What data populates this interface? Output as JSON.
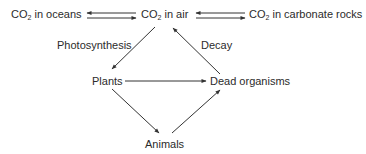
{
  "diagram": {
    "colors": {
      "text": "#2b2b2b",
      "arrow": "#333333",
      "background": "#ffffff"
    },
    "nodes": {
      "co2_oceans": {
        "prefix": "CO",
        "sub": "2",
        "suffix": " in oceans"
      },
      "co2_air": {
        "prefix": "CO",
        "sub": "2",
        "suffix": " in air"
      },
      "co2_rocks": {
        "prefix": "CO",
        "sub": "2",
        "suffix": " in carbonate rocks"
      },
      "plants": {
        "label": "Plants"
      },
      "dead": {
        "label": "Dead organisms"
      },
      "animals": {
        "label": "Animals"
      }
    },
    "edge_labels": {
      "photosynthesis": "Photosynthesis",
      "decay": "Decay"
    },
    "edges": [
      {
        "from": "CO2 in air",
        "to": "CO2 in oceans"
      },
      {
        "from": "CO2 in oceans",
        "to": "CO2 in air"
      },
      {
        "from": "CO2 in carbonate rocks",
        "to": "CO2 in air"
      },
      {
        "from": "CO2 in air",
        "to": "CO2 in carbonate rocks"
      },
      {
        "from": "CO2 in air",
        "to": "Plants",
        "label": "Photosynthesis"
      },
      {
        "from": "Dead organisms",
        "to": "CO2 in air",
        "label": "Decay"
      },
      {
        "from": "Plants",
        "to": "Dead organisms"
      },
      {
        "from": "Plants",
        "to": "Animals"
      },
      {
        "from": "Animals",
        "to": "Dead organisms"
      }
    ]
  }
}
